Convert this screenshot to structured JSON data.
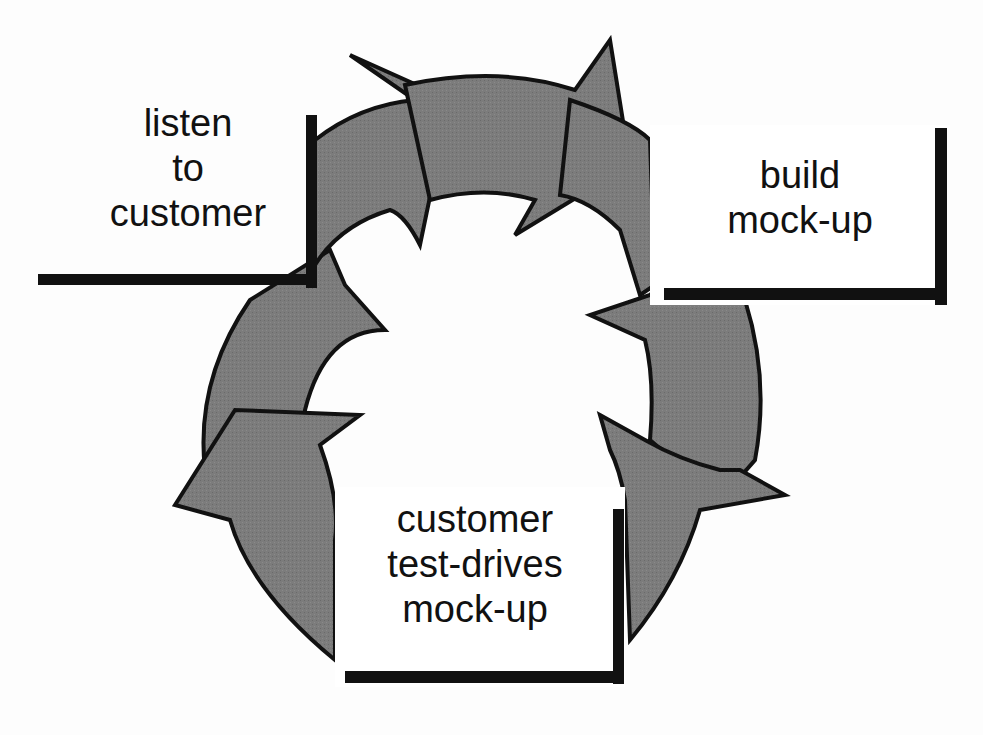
{
  "diagram": {
    "type": "cycle",
    "direction": "clockwise",
    "arrow_fill": "#7a7a7a",
    "arrow_stroke": "#111111",
    "steps": [
      {
        "id": "listen",
        "lines": [
          "listen",
          "to",
          "customer"
        ]
      },
      {
        "id": "build",
        "lines": [
          "build",
          "mock-up"
        ]
      },
      {
        "id": "test",
        "lines": [
          "customer",
          "test-drives",
          "mock-up"
        ]
      }
    ]
  }
}
